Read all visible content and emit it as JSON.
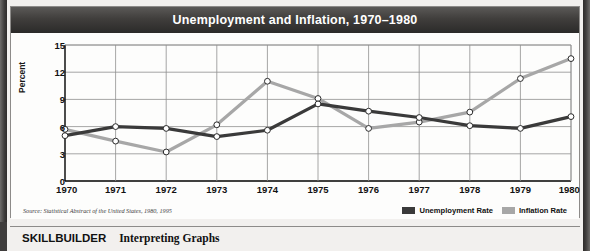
{
  "figure": {
    "title": "Unemployment and Inflation, 1970–1980",
    "source": "Source: Statistical Abstract of the United States, 1980, 1995"
  },
  "footer": {
    "skillbuilder_label": "SKILLBUILDER",
    "skillbuilder_topic": "Interpreting Graphs"
  },
  "colors": {
    "unemployment": "#3a3a3a",
    "inflation": "#a7a7a7",
    "grid": "#8f8f8f",
    "axis": "#000000",
    "title_bar": "#3f3d3c"
  },
  "chart_data": {
    "type": "line",
    "title": "Unemployment and Inflation, 1970–1980",
    "xlabel": "",
    "ylabel": "Percent",
    "x": [
      1970,
      1971,
      1972,
      1973,
      1974,
      1975,
      1976,
      1977,
      1978,
      1979,
      1980
    ],
    "xtick_labels": [
      "1970",
      "1971",
      "1972",
      "1973",
      "1974",
      "1975",
      "1976",
      "1977",
      "1978",
      "1979",
      "1980"
    ],
    "ytick_labels": [
      "0",
      "3",
      "6",
      "9",
      "12",
      "15"
    ],
    "yticks": [
      0,
      3,
      6,
      9,
      12,
      15
    ],
    "ylim": [
      0,
      15
    ],
    "xlim": [
      1970,
      1980
    ],
    "grid": true,
    "legend_position": "bottom-right",
    "series": [
      {
        "name": "Unemployment Rate",
        "color": "#3a3a3a",
        "values": [
          5.0,
          6.0,
          5.8,
          4.9,
          5.6,
          8.5,
          7.7,
          7.0,
          6.1,
          5.8,
          7.1
        ]
      },
      {
        "name": "Inflation Rate",
        "color": "#a7a7a7",
        "values": [
          5.7,
          4.4,
          3.2,
          6.2,
          11.0,
          9.1,
          5.8,
          6.5,
          7.6,
          11.3,
          13.5
        ]
      }
    ]
  }
}
